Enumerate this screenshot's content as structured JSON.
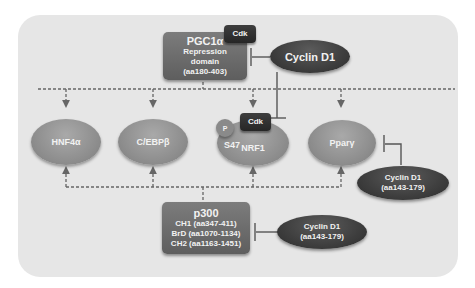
{
  "diagram": {
    "pgc1a": {
      "title": "PGC1α",
      "line1": "Repression",
      "line2": "domain",
      "line3": "(aa180-403)",
      "kinase": "Cdk"
    },
    "cyclin_top": {
      "label": "Cyclin D1"
    },
    "targets": [
      {
        "label": "HNF4α"
      },
      {
        "label": "C/EBPβ"
      },
      {
        "label": "NRF1",
        "site": "S47",
        "phospho": "P",
        "kinase": "Cdk"
      },
      {
        "label": "Pparγ"
      }
    ],
    "cyclin_right": {
      "line1": "Cyclin D1",
      "line2": "(aa143-179)"
    },
    "p300": {
      "title": "p300",
      "domains": [
        "CH1 (aa347-411)",
        "BrD (aa1070-1134)",
        "CH2 (aa1163-1451)"
      ]
    },
    "cyclin_bottom": {
      "line1": "Cyclin D1",
      "line2": "(aa143-179)"
    },
    "colors": {
      "panel": "#e6e6e6",
      "light_node": "#8f8f8f",
      "mid_box": "#6a6a6a",
      "dark_node": "#333333",
      "line": "#555555"
    }
  }
}
